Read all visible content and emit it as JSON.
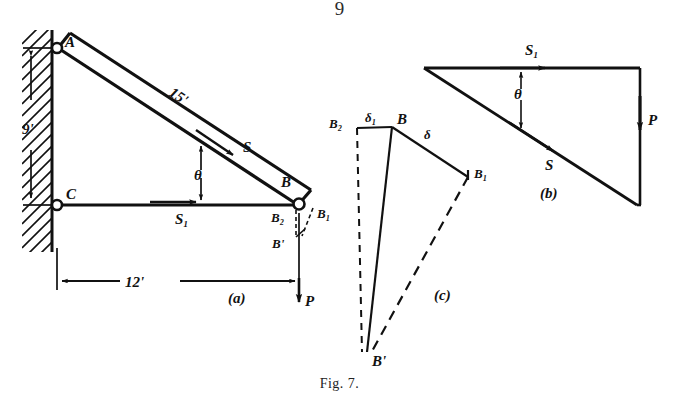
{
  "page": {
    "number": "9",
    "caption_prefix": "F",
    "caption_smallcaps": "IG",
    "caption_suffix": ". 7."
  },
  "figure": {
    "label": "Fig. 7.",
    "ink_color": "#111111",
    "background_color": "#ffffff",
    "panels": [
      {
        "key": "a",
        "label": "(a)",
        "description": "space diagram of bracket with wall, members AB and CB, load P"
      },
      {
        "key": "b",
        "label": "(b)",
        "description": "force triangle: S1 horizontal, S inclined, P vertical"
      },
      {
        "key": "c",
        "label": "(c)",
        "description": "Williot displacement diagram with deltas"
      }
    ]
  },
  "panel_a": {
    "label": "(a)",
    "joints": [
      {
        "name": "A",
        "label": "A"
      },
      {
        "name": "C",
        "label": "C"
      },
      {
        "name": "B",
        "label": "B"
      }
    ],
    "members": [
      {
        "name": "AB",
        "length_label": "15'",
        "force_label": "S"
      },
      {
        "name": "CB",
        "force_label": "S₁"
      }
    ],
    "dimensions": [
      {
        "name": "vertical-wall-height",
        "label": "9'"
      },
      {
        "name": "horizontal-span",
        "label": "12'"
      }
    ],
    "angle_label": "θ",
    "load_label": "P",
    "displacement_points": [
      {
        "name": "B2",
        "label": "B₂"
      },
      {
        "name": "B1",
        "label": "B₁"
      },
      {
        "name": "Bprime",
        "label": "B'"
      }
    ]
  },
  "panel_b": {
    "label": "(b)",
    "vectors": [
      {
        "name": "S1",
        "label": "S₁",
        "direction": "horizontal-right"
      },
      {
        "name": "S",
        "label": "S",
        "direction": "inclined-down-right"
      },
      {
        "name": "P",
        "label": "P",
        "direction": "vertical-down"
      }
    ],
    "angle_label": "θ"
  },
  "panel_c": {
    "label": "(c)",
    "points": [
      {
        "name": "B2",
        "label": "B₂"
      },
      {
        "name": "B",
        "label": "B"
      },
      {
        "name": "B1",
        "label": "B₁"
      },
      {
        "name": "Bprime",
        "label": "B'"
      }
    ],
    "segments": [
      {
        "name": "delta1",
        "label": "δ₁"
      },
      {
        "name": "delta",
        "label": "δ"
      }
    ]
  }
}
